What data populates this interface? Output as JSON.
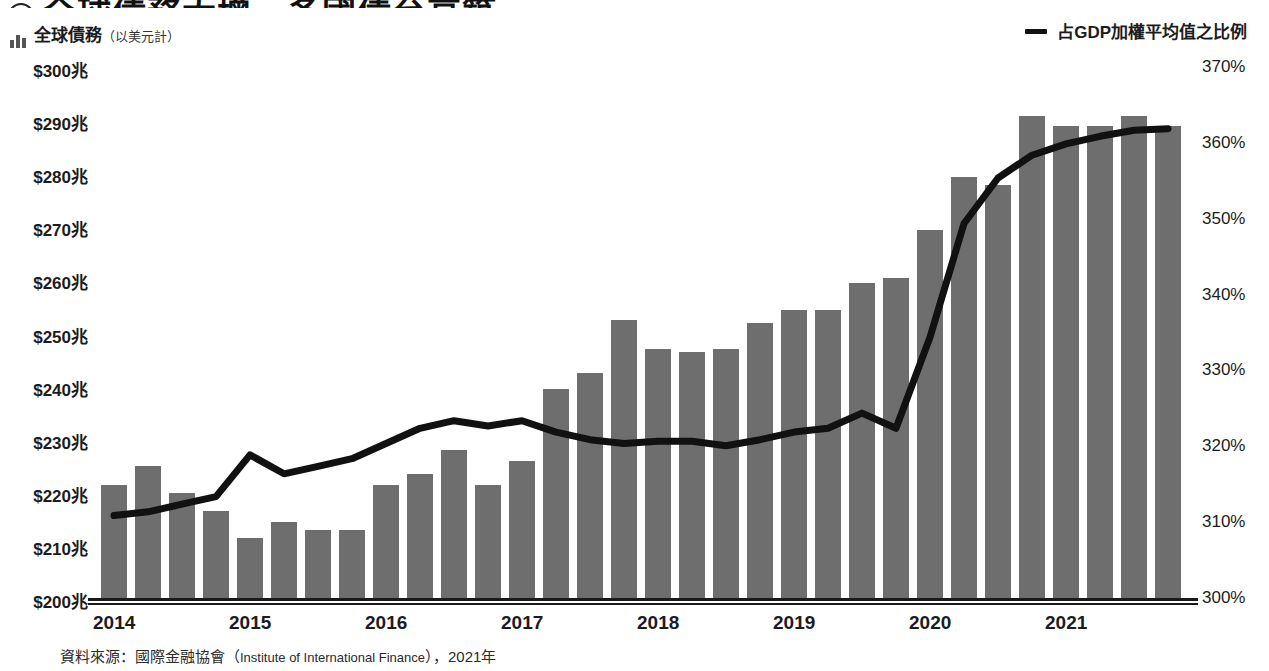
{
  "header": {
    "title": "全球債務大增，多國債台高築",
    "badge_icon": "numbered-circle-icon"
  },
  "subtitle": {
    "icon": "bar-chart-icon",
    "label": "全球債務",
    "note": "（以美元計）"
  },
  "legend": {
    "line_label": "占GDP加權平均值之比例",
    "line_color": "#111111",
    "bar_color": "#6e6e6e"
  },
  "source": {
    "prefix": "資料來源：國際金融協會（",
    "english": "Institute of International Finance",
    "suffix": "），2021年"
  },
  "chart_data": {
    "type": "bar",
    "title": "全球債務大增，多國債台高築",
    "xlabel": "",
    "ylabel": "全球債務（以美元計）",
    "y2label": "占GDP加權平均值之比例",
    "ylim": [
      200,
      300
    ],
    "y2lim": [
      300,
      370
    ],
    "yticks": [
      "$200兆",
      "$210兆",
      "$220兆",
      "$230兆",
      "$240兆",
      "$250兆",
      "$260兆",
      "$270兆",
      "$280兆",
      "$290兆",
      "$300兆"
    ],
    "y2ticks": [
      "300%",
      "310%",
      "320%",
      "330%",
      "340%",
      "350%",
      "360%",
      "370%"
    ],
    "xtick_labels": [
      "2014",
      "2015",
      "2016",
      "2017",
      "2018",
      "2019",
      "2020",
      "2021"
    ],
    "grid": false,
    "legend_position": "top-right",
    "categories": [
      "2014 Q1",
      "2014 Q2",
      "2014 Q3",
      "2014 Q4",
      "2015 Q1",
      "2015 Q2",
      "2015 Q3",
      "2015 Q4",
      "2016 Q1",
      "2016 Q2",
      "2016 Q3",
      "2016 Q4",
      "2017 Q1",
      "2017 Q2",
      "2017 Q3",
      "2017 Q4",
      "2018 Q1",
      "2018 Q2",
      "2018 Q3",
      "2018 Q4",
      "2019 Q1",
      "2019 Q2",
      "2019 Q3",
      "2019 Q4",
      "2020 Q1",
      "2020 Q2",
      "2020 Q3",
      "2020 Q4",
      "2021 Q1",
      "2021 Q2",
      "2021 Q3",
      "2021 Q4"
    ],
    "series": [
      {
        "name": "全球債務（以美元計）",
        "type": "bar",
        "axis": "left",
        "unit": "兆美元",
        "color": "#6e6e6e",
        "values": [
          221.5,
          225.0,
          220.0,
          216.5,
          211.5,
          214.5,
          213.0,
          213.0,
          221.5,
          223.5,
          228.0,
          221.5,
          226.0,
          239.5,
          242.5,
          252.5,
          247.0,
          246.5,
          247.0,
          252.0,
          254.5,
          254.5,
          259.5,
          260.5,
          269.5,
          279.5,
          278.0,
          291.0,
          289.0,
          289.0,
          291.0,
          289.0
        ]
      },
      {
        "name": "占GDP加權平均值之比例",
        "type": "line",
        "axis": "right",
        "unit": "%",
        "color": "#111111",
        "values": [
          311.0,
          311.5,
          312.5,
          313.5,
          319.0,
          316.5,
          317.5,
          318.5,
          320.5,
          322.5,
          323.5,
          322.8,
          323.5,
          322.0,
          321.0,
          320.5,
          320.8,
          320.8,
          320.2,
          321.0,
          322.0,
          322.5,
          324.5,
          322.5,
          334.5,
          349.5,
          355.5,
          358.5,
          360.0,
          361.0,
          361.8,
          362.0
        ]
      }
    ]
  }
}
